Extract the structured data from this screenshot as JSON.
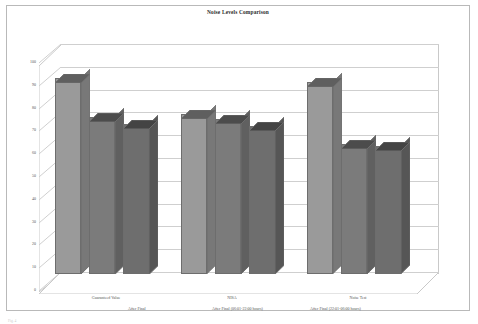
{
  "chart_data": {
    "type": "bar",
    "title": "Noise Levels Comparison",
    "xlabel": "",
    "ylabel": "",
    "ylim": [
      0,
      100
    ],
    "grid": true,
    "legend_position": "bottom",
    "yticks": [
      "100",
      "90",
      "80",
      "70",
      "60",
      "50",
      "40",
      "30",
      "20",
      "10",
      "0"
    ],
    "categories": [
      "Guaranteed Value",
      "NISA",
      "Noise Test"
    ],
    "series": [
      {
        "name": "After Final",
        "values": [
          86,
          70,
          84
        ]
      },
      {
        "name": "After Final (06:01-22:00 hours)",
        "values": [
          69,
          68,
          57
        ]
      },
      {
        "name": "After Final (22:01-06:00 hours)",
        "values": [
          66,
          65,
          56
        ]
      }
    ],
    "colors": {
      "series_face": [
        "#9a9a9a",
        "#7b7b7b",
        "#6e6e6e"
      ],
      "outline": "#6d6d6d",
      "gridline": "#cfcfcf",
      "frame": "#b9b9b9",
      "background": "#ffffff",
      "text": "#555555"
    }
  },
  "footnote": "Fig. 4"
}
